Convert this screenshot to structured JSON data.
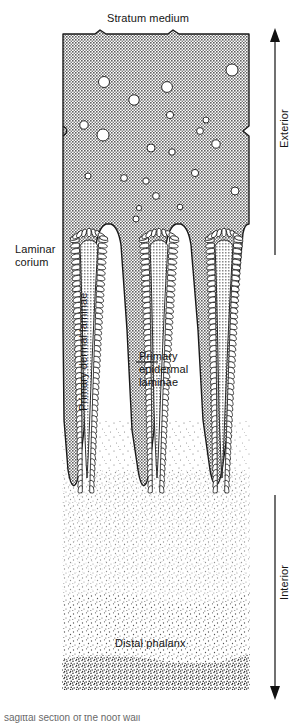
{
  "figure": {
    "title": "Stratum medium",
    "labels": {
      "stratum_medium": "Stratum medium",
      "laminar_corium": "Laminar\ncorium",
      "primary_dermal_laminae": "Primary dermal laminae",
      "primary_epidermal_laminae": "Primary\nepidermal\nlaminae",
      "distal_phalanx": "Distal phalanx",
      "exterior": "Exterior",
      "interior": "Interior"
    },
    "caption_partial": "sagittal section of the hoof wall",
    "axis": {
      "top_arrow_direction": "up",
      "top_arrow_label": "Exterior",
      "bottom_arrow_direction": "down",
      "bottom_arrow_label": "Interior"
    },
    "colors": {
      "stratum_medium_fill": "#9d9d9d",
      "lamina_fill": "#a8a8a8",
      "outline": "#1a1a1a",
      "background": "#ffffff",
      "tubule_fill": "#ffffff",
      "bone_stipple": "#2a2a2a"
    },
    "structures": [
      {
        "name": "stratum-medium",
        "description": "hatched grey horn wall band with circular horn tubules"
      },
      {
        "name": "primary-epidermal-laminae",
        "description": "three tapering grey wedges projecting inward"
      },
      {
        "name": "primary-dermal-laminae",
        "description": "feathered white interdigitating laminae along wedge margins"
      },
      {
        "name": "laminar-corium",
        "description": "stippled dermal region between epidermal laminae and bone"
      },
      {
        "name": "distal-phalanx",
        "description": "dense stippled bone at the base of the section"
      }
    ],
    "tubules": [
      {
        "cx": 84,
        "cy": 125,
        "r": 4.2
      },
      {
        "cx": 88,
        "cy": 176,
        "r": 3.0
      },
      {
        "cx": 103,
        "cy": 135,
        "r": 6.0
      },
      {
        "cx": 104,
        "cy": 82,
        "r": 5.5
      },
      {
        "cx": 124,
        "cy": 178,
        "r": 3.4
      },
      {
        "cx": 134,
        "cy": 100,
        "r": 5.2
      },
      {
        "cx": 136,
        "cy": 219,
        "r": 3.0
      },
      {
        "cx": 139,
        "cy": 208,
        "r": 2.6
      },
      {
        "cx": 146,
        "cy": 181,
        "r": 3.2
      },
      {
        "cx": 151,
        "cy": 148,
        "r": 4.0
      },
      {
        "cx": 156,
        "cy": 196,
        "r": 3.4
      },
      {
        "cx": 167,
        "cy": 87,
        "r": 5.4
      },
      {
        "cx": 170,
        "cy": 115,
        "r": 3.6
      },
      {
        "cx": 172,
        "cy": 152,
        "r": 3.2
      },
      {
        "cx": 180,
        "cy": 207,
        "r": 2.8
      },
      {
        "cx": 195,
        "cy": 173,
        "r": 3.6
      },
      {
        "cx": 200,
        "cy": 131,
        "r": 3.4
      },
      {
        "cx": 206,
        "cy": 120,
        "r": 3.0
      },
      {
        "cx": 216,
        "cy": 144,
        "r": 4.2
      },
      {
        "cx": 232,
        "cy": 70,
        "r": 6.0
      },
      {
        "cx": 235,
        "cy": 191,
        "r": 4.0
      }
    ]
  }
}
